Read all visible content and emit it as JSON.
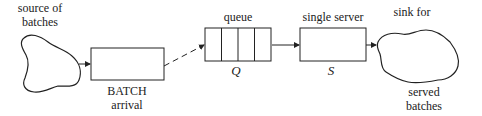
{
  "diagram": {
    "source": {
      "label_line1": "source of",
      "label_line2": "batches"
    },
    "batch_arrival": {
      "label_line1": "BATCH",
      "label_line2": "arrival"
    },
    "queue": {
      "label": "queue",
      "symbol": "Q",
      "slots": 4
    },
    "server": {
      "label": "single server",
      "symbol": "S"
    },
    "sink": {
      "label_line1": "sink for",
      "label_line2": "served",
      "label_line3": "batches"
    },
    "edges": [
      {
        "from": "source",
        "to": "batch_arrival",
        "style": "solid"
      },
      {
        "from": "batch_arrival",
        "to": "queue",
        "style": "dashed"
      },
      {
        "from": "queue",
        "to": "server",
        "style": "solid"
      },
      {
        "from": "server",
        "to": "sink",
        "style": "solid"
      }
    ],
    "colors": {
      "stroke": "#222222",
      "background": "#ffffff"
    }
  }
}
